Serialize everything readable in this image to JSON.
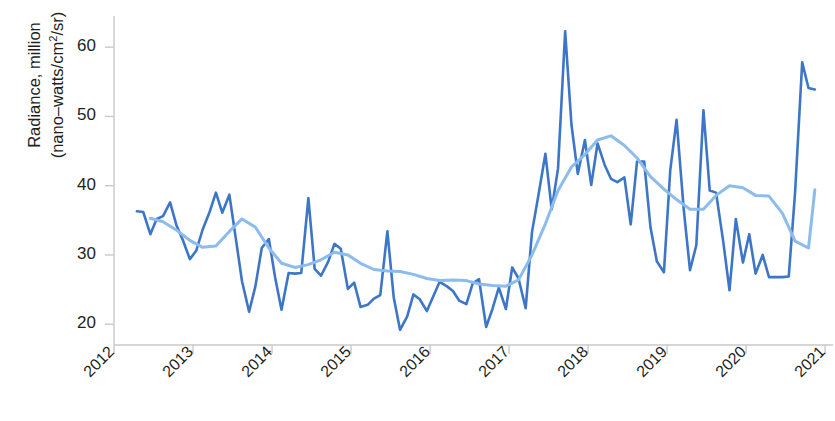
{
  "chart_data": {
    "type": "line",
    "title": "",
    "xlabel": "",
    "ylabel": "Radiance, million (nano-watts/cm²/sr)",
    "ylabel_line1": "Radiance, million",
    "ylabel_line2_pre": "(nano–watts/cm",
    "ylabel_line2_sup": "2",
    "ylabel_line2_post": "/sr)",
    "ylim": [
      17.0,
      64.5
    ],
    "xlim": [
      2012.0,
      2021.1
    ],
    "yticks": [
      20,
      30,
      40,
      50,
      60
    ],
    "ytick_labels": [
      "20",
      "30",
      "40",
      "50",
      "60"
    ],
    "xticks": [
      2012,
      2013,
      2014,
      2015,
      2016,
      2017,
      2018,
      2019,
      2020,
      2021
    ],
    "xtick_labels": [
      "2012",
      "2013",
      "2014",
      "2015",
      "2016",
      "2017",
      "2018",
      "2019",
      "2020",
      "2021"
    ],
    "grid": false,
    "legend": "none",
    "colors": {
      "monthly": "#3D76C6",
      "smoothed": "#8CBCEE",
      "axis": "#c9c9c9",
      "text": "#231f20",
      "background": "#ffffff"
    },
    "series": [
      {
        "name": "monthly",
        "color": "#3D76C6",
        "line_width": 2.6,
        "x": [
          2012.29,
          2012.37,
          2012.46,
          2012.54,
          2012.62,
          2012.71,
          2012.79,
          2012.87,
          2012.96,
          2013.04,
          2013.12,
          2013.21,
          2013.29,
          2013.37,
          2013.46,
          2013.54,
          2013.62,
          2013.71,
          2013.79,
          2013.87,
          2013.96,
          2014.04,
          2014.12,
          2014.21,
          2014.29,
          2014.37,
          2014.46,
          2014.54,
          2014.62,
          2014.71,
          2014.79,
          2014.87,
          2014.96,
          2015.04,
          2015.12,
          2015.21,
          2015.29,
          2015.37,
          2015.46,
          2015.54,
          2015.62,
          2015.71,
          2015.79,
          2015.87,
          2015.96,
          2016.04,
          2016.12,
          2016.21,
          2016.29,
          2016.37,
          2016.46,
          2016.54,
          2016.62,
          2016.71,
          2016.79,
          2016.87,
          2016.96,
          2017.04,
          2017.12,
          2017.21,
          2017.29,
          2017.37,
          2017.46,
          2017.54,
          2017.62,
          2017.71,
          2017.79,
          2017.87,
          2017.96,
          2018.04,
          2018.12,
          2018.21,
          2018.29,
          2018.37,
          2018.46,
          2018.54,
          2018.62,
          2018.71,
          2018.79,
          2018.87,
          2018.96,
          2019.04,
          2019.12,
          2019.21,
          2019.29,
          2019.37,
          2019.46,
          2019.54,
          2019.62,
          2019.71,
          2019.79,
          2019.87,
          2019.96,
          2020.04,
          2020.12,
          2020.21,
          2020.29,
          2020.37,
          2020.46,
          2020.54,
          2020.62,
          2020.71,
          2020.79,
          2020.87
        ],
        "values": [
          36.3,
          36.2,
          33.0,
          35.2,
          35.6,
          37.6,
          34.3,
          32.2,
          29.4,
          30.6,
          33.6,
          36.2,
          39.0,
          36.1,
          38.7,
          32.5,
          26.2,
          21.8,
          25.5,
          31.0,
          32.3,
          26.7,
          22.1,
          27.4,
          27.3,
          27.4,
          38.2,
          28.0,
          27.0,
          29.0,
          31.6,
          30.9,
          25.1,
          26.0,
          22.5,
          22.8,
          23.7,
          24.2,
          33.4,
          23.9,
          19.2,
          21.1,
          24.3,
          23.6,
          21.9,
          24.0,
          26.1,
          25.5,
          24.8,
          23.4,
          22.9,
          25.9,
          26.5,
          19.6,
          22.2,
          25.3,
          22.2,
          28.2,
          26.6,
          22.3,
          33.3,
          38.5,
          44.6,
          36.6,
          42.5,
          62.3,
          48.8,
          41.7,
          46.6,
          40.1,
          46.1,
          43.0,
          41.0,
          40.5,
          41.2,
          34.4,
          43.5,
          43.5,
          34.0,
          29.1,
          27.5,
          42.2,
          49.5,
          36.7,
          27.8,
          31.4,
          50.9,
          39.3,
          39.0,
          32.0,
          24.9,
          35.2,
          28.9,
          33.0,
          27.3,
          30.0,
          26.8,
          26.8,
          26.8,
          26.9,
          39.0,
          57.8,
          54.1,
          53.9
        ]
      },
      {
        "name": "smoothed",
        "color": "#8CBCEE",
        "line_width": 3.0,
        "x": [
          2012.46,
          2012.62,
          2012.79,
          2012.96,
          2013.12,
          2013.29,
          2013.46,
          2013.62,
          2013.79,
          2013.96,
          2014.12,
          2014.29,
          2014.46,
          2014.62,
          2014.79,
          2014.96,
          2015.12,
          2015.29,
          2015.46,
          2015.62,
          2015.79,
          2015.96,
          2016.12,
          2016.29,
          2016.46,
          2016.62,
          2016.79,
          2016.96,
          2017.12,
          2017.29,
          2017.46,
          2017.62,
          2017.79,
          2017.96,
          2018.12,
          2018.29,
          2018.46,
          2018.62,
          2018.79,
          2018.96,
          2019.12,
          2019.29,
          2019.46,
          2019.62,
          2019.79,
          2019.96,
          2020.12,
          2020.29,
          2020.46,
          2020.62,
          2020.79,
          2020.87
        ],
        "values": [
          35.3,
          34.8,
          33.6,
          32.1,
          31.1,
          31.3,
          33.4,
          35.2,
          34.0,
          31.0,
          28.8,
          28.2,
          28.6,
          29.3,
          30.4,
          30.0,
          28.8,
          27.9,
          27.7,
          27.6,
          27.2,
          26.6,
          26.3,
          26.4,
          26.3,
          25.8,
          25.6,
          25.5,
          26.4,
          30.0,
          34.5,
          39.3,
          42.7,
          44.5,
          46.6,
          47.2,
          45.8,
          44.0,
          41.3,
          39.5,
          38.0,
          36.6,
          36.6,
          38.6,
          40.0,
          39.7,
          38.6,
          38.5,
          36.0,
          32.0,
          31.0,
          39.4
        ]
      }
    ]
  },
  "axis": {
    "y_tick_values": [
      "60",
      "50",
      "40",
      "30",
      "20"
    ],
    "x_tick_values": [
      "2012",
      "2013",
      "2014",
      "2015",
      "2016",
      "2017",
      "2018",
      "2019",
      "2020",
      "2021"
    ]
  }
}
